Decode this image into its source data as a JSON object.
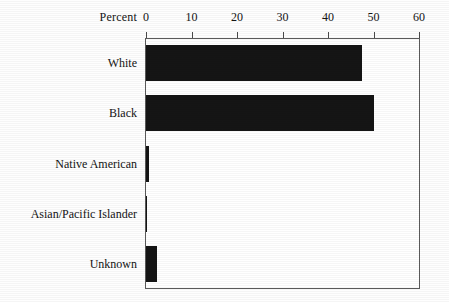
{
  "chart_data": {
    "type": "bar",
    "orientation": "horizontal",
    "title": "",
    "xlabel": "Percent",
    "ylabel": "",
    "categories": [
      "White",
      "Black",
      "Native American",
      "Asian/Pacific Islander",
      "Unknown"
    ],
    "values": [
      47.5,
      50.2,
      0.7,
      0.3,
      2.4
    ],
    "xlim": [
      0,
      60
    ],
    "xticks": [
      0,
      10,
      20,
      30,
      40,
      50,
      60
    ],
    "xtick_labels": [
      "0",
      "10",
      "20",
      "30",
      "40",
      "50",
      "60"
    ],
    "grid": false,
    "legend": null,
    "axis_position": "top",
    "bar_color": "#151515",
    "series": [
      {
        "name": "Percent",
        "values": [
          47.5,
          50.2,
          0.7,
          0.3,
          2.4
        ]
      }
    ]
  },
  "axis": {
    "title_label": "Percent"
  },
  "colors": {
    "bar": "#151515",
    "frame": "#5a5a5a",
    "text": "#141414",
    "background": "#ffffff"
  }
}
